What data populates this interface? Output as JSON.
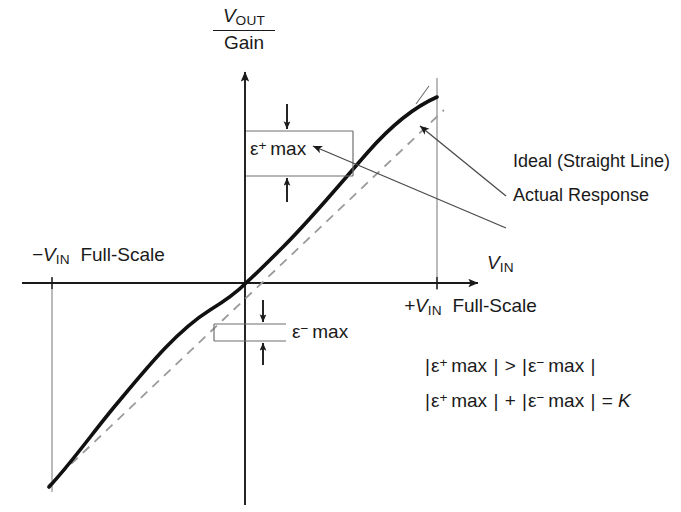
{
  "diagram": {
    "type": "technical-illustration",
    "title_parts": {
      "y_axis_numerator": "V",
      "y_axis_numerator_sub": "OUT",
      "y_axis_denominator": "Gain"
    },
    "axes": {
      "x_label_main": "V",
      "x_label_sub": "IN",
      "x_negative_full_scale": "−V",
      "x_negative_full_scale_sub": "IN",
      "x_negative_full_scale_tail": "Full-Scale",
      "x_positive_full_scale": "+V",
      "x_positive_full_scale_sub": "IN",
      "x_positive_full_scale_tail": "Full-Scale"
    },
    "error_labels": {
      "positive_symbol": "ε",
      "positive_sign": "+",
      "positive_text": "max",
      "negative_symbol": "ε",
      "negative_sign": "−",
      "negative_text": "max"
    },
    "callouts": {
      "ideal": "Ideal (Straight Line)",
      "actual": "Actual Response"
    },
    "formulas": {
      "line1": {
        "lhs_symbol": "ε",
        "lhs_sign": "+",
        "lhs_text": "max",
        "operator": ">",
        "rhs_symbol": "ε",
        "rhs_sign": "−",
        "rhs_text": "max",
        "bar": "|"
      },
      "line2": {
        "lhs_symbol": "ε",
        "lhs_sign": "+",
        "lhs_text": "max",
        "operator": "+",
        "rhs_symbol": "ε",
        "rhs_sign": "−",
        "rhs_text": "max",
        "equals": "=",
        "result": "K",
        "bar": "|"
      }
    },
    "colors": {
      "ink": "#1a1a1a",
      "curve": "#111111",
      "ideal_dashed": "#8a8a8a",
      "thin_rule": "#6f6f6f",
      "background": "#ffffff"
    },
    "geometry": {
      "origin_x": 246,
      "origin_y": 283,
      "x_axis_y": 283,
      "y_axis_x": 245,
      "left_fullscale_x": 52,
      "right_fullscale_x": 437,
      "curve_left_end_y": 487,
      "curve_right_end_y": 96
    }
  }
}
